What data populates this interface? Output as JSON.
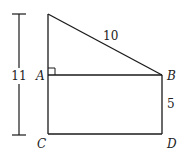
{
  "diagram": {
    "points": {
      "apex": {
        "x": 48,
        "y": 14
      },
      "A": {
        "label": "A",
        "x": 48,
        "y": 75
      },
      "B": {
        "label": "B",
        "x": 162,
        "y": 75
      },
      "C": {
        "label": "C",
        "x": 48,
        "y": 134
      },
      "D": {
        "label": "D",
        "x": 162,
        "y": 134
      }
    },
    "measurements": {
      "hypotenuse": "10",
      "bd_side": "5",
      "total_height": "11"
    },
    "line_color": "#1a1a1a"
  }
}
